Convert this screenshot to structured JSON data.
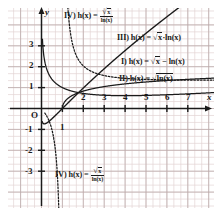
{
  "chart_data": {
    "type": "line",
    "title": "",
    "xlabel": "x",
    "ylabel": "y",
    "xlim": [
      -0.4,
      8.2
    ],
    "ylim": [
      -3.9,
      4.3
    ],
    "grid": true,
    "grid_step": 0.3333,
    "legend_position": "inline-annotations",
    "xticks": [
      1,
      2,
      3,
      4,
      5,
      6,
      7
    ],
    "xtick_labels": [
      "1",
      "2",
      "3",
      "4",
      "5",
      "6",
      "7"
    ],
    "yticks": [
      -3,
      -2,
      -1,
      1,
      2,
      3
    ],
    "ytick_labels": [
      "-3",
      "-2",
      "-1",
      "1",
      "2",
      "3"
    ],
    "origin_label": "O",
    "series": [
      {
        "id": "I",
        "name": "I) h(x) = √x − ln(x)",
        "expression": "sqrt(x) - ln(x)",
        "style": "dashed",
        "x": [
          0.22,
          0.3,
          0.4,
          0.5,
          0.6,
          0.8,
          1.0,
          1.3,
          1.6,
          2.0,
          2.5,
          3.0,
          3.5,
          4.0,
          4.5,
          5.0,
          5.5,
          6.0,
          6.5,
          7.0,
          7.5,
          8.0
        ],
        "y": [
          2.0,
          1.75,
          1.55,
          1.4,
          1.29,
          1.12,
          1.0,
          0.88,
          0.79,
          0.72,
          0.66,
          0.63,
          0.62,
          0.61,
          0.62,
          0.63,
          0.64,
          0.66,
          0.68,
          0.7,
          0.72,
          0.75
        ]
      },
      {
        "id": "II",
        "name": "II) h(x) = √ln(x)",
        "expression": "sqrt(ln(x))",
        "style": "dashed",
        "x": [
          1.0,
          1.1,
          1.25,
          1.5,
          1.8,
          2.2,
          2.7,
          3.3,
          4.0,
          4.8,
          5.6,
          6.4,
          7.2,
          8.0
        ],
        "y": [
          0.0,
          0.309,
          0.472,
          0.637,
          0.767,
          0.888,
          0.997,
          1.093,
          1.177,
          1.252,
          1.314,
          1.363,
          1.406,
          1.442
        ]
      },
      {
        "id": "III",
        "name": "III) h(x) = √x·ln(x)",
        "expression": "sqrt(x)*ln(x)",
        "style": "solid",
        "x": [
          0.1,
          0.2,
          0.3,
          0.4,
          0.5,
          0.7,
          1.0,
          1.4,
          2.0,
          2.8,
          3.6,
          4.6,
          5.6,
          6.6,
          7.6,
          8.2
        ],
        "y": [
          -0.728,
          -0.72,
          -0.659,
          -0.58,
          -0.49,
          -0.298,
          0.0,
          0.398,
          0.98,
          1.723,
          2.43,
          3.273,
          4.078,
          4.846,
          5.586,
          6.01
        ]
      },
      {
        "id": "IV",
        "name": "IV) h(x) = √x / ln(x)",
        "expression": "sqrt(x)/ln(x)",
        "style": "dotted",
        "branch_left_x": [
          0.28,
          0.34,
          0.42,
          0.52,
          0.62,
          0.72,
          0.8,
          0.86,
          0.9,
          0.93,
          0.955
        ],
        "branch_left_y": [
          -0.416,
          -0.54,
          -0.726,
          -1.103,
          -1.637,
          -2.583,
          -3.905,
          -5.9,
          -8.1,
          -11.9,
          -20.5
        ],
        "branch_right_x": [
          1.045,
          1.08,
          1.15,
          1.25,
          1.4,
          1.6,
          1.9,
          2.3,
          2.8,
          3.4,
          4.2,
          5.0,
          6.0,
          7.0,
          8.0
        ],
        "branch_right_y": [
          23.2,
          13.5,
          7.64,
          4.99,
          3.52,
          2.69,
          2.15,
          1.82,
          1.63,
          1.53,
          1.46,
          1.39,
          1.39,
          1.36,
          1.36
        ],
        "asymptote_x": 1.0
      }
    ]
  },
  "labels": {
    "axis_x": "x",
    "axis_y": "y",
    "origin": "O",
    "x_ticks": [
      "1",
      "2",
      "3",
      "4",
      "5",
      "6",
      "7"
    ],
    "y_ticks_pos": [
      "3",
      "2",
      "1"
    ],
    "y_ticks_neg": [
      "-1",
      "-2",
      "-3"
    ],
    "fn_I_prefix": "I) h(x) = ",
    "fn_I_radical": "√",
    "fn_I_radarg": "x",
    "fn_I_suffix": " − ln(x)",
    "fn_II_prefix": "II) h(x) = ",
    "fn_II_radical": "√",
    "fn_II_radarg": "ln(x)",
    "fn_III_prefix": "III) h(x) = ",
    "fn_III_radical": "√",
    "fn_III_radarg": "x",
    "fn_III_suffix": "·ln(x)",
    "fn_IV_top_prefix": "IV) h(x) = ",
    "fn_IV_top_num_radical": "√",
    "fn_IV_top_num_arg": "x",
    "fn_IV_top_den": "ln(x)",
    "fn_IV_bot_prefix": "IV) h(x) = ",
    "fn_IV_bot_num_radical": "√",
    "fn_IV_bot_num_arg": "x",
    "fn_IV_bot_den": "ln(x)"
  },
  "colors": {
    "grid_minor": "#e3d4d4",
    "grid_major": "#b9a8a8",
    "axis": "#1a1a1a",
    "curve": "#1a1a1a",
    "background": "#ffffff"
  }
}
